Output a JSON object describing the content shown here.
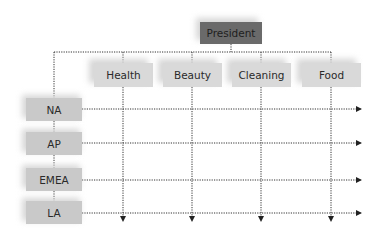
{
  "diagram": {
    "type": "matrix-org-chart",
    "root": {
      "label": "President"
    },
    "functions": [
      {
        "label": "Health"
      },
      {
        "label": "Beauty"
      },
      {
        "label": "Cleaning"
      },
      {
        "label": "Food"
      }
    ],
    "regions": [
      {
        "label": "NA"
      },
      {
        "label": "AP"
      },
      {
        "label": "EMEA"
      },
      {
        "label": "LA"
      }
    ],
    "colors": {
      "president_fill": "#6a6a6a",
      "function_fill": "#d9d9d9",
      "region_fill": "#c9c9c9",
      "connector": "#222222"
    }
  }
}
